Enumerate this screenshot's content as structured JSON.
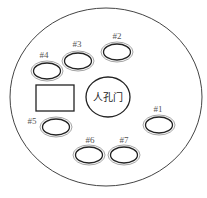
{
  "diagram": {
    "type": "layout-schematic",
    "outer_boundary": {
      "shape": "circle",
      "cx": 106,
      "cy": 97,
      "rx": 96,
      "ry": 89
    },
    "manhole": {
      "label": "人孔门",
      "cx": 108,
      "cy": 97,
      "rx": 22,
      "ry": 20
    },
    "rectangle": {
      "x": 36,
      "y": 85,
      "width": 38,
      "height": 26
    },
    "ports": [
      {
        "id": "#1",
        "label": "#1",
        "cx": 159,
        "cy": 125,
        "label_x": 158,
        "label_y": 112
      },
      {
        "id": "#2",
        "label": "#2",
        "cx": 117,
        "cy": 52,
        "label_x": 117,
        "label_y": 39
      },
      {
        "id": "#3",
        "label": "#3",
        "cx": 78,
        "cy": 61,
        "label_x": 77,
        "label_y": 47
      },
      {
        "id": "#4",
        "label": "#4",
        "cx": 47,
        "cy": 71,
        "label_x": 44,
        "label_y": 58
      },
      {
        "id": "#5",
        "label": "#5",
        "cx": 56,
        "cy": 127,
        "label_x": 32,
        "label_y": 124
      },
      {
        "id": "#6",
        "label": "#6",
        "cx": 89,
        "cy": 155,
        "label_x": 90,
        "label_y": 143
      },
      {
        "id": "#7",
        "label": "#7",
        "cx": 124,
        "cy": 155,
        "label_x": 124,
        "label_y": 143
      }
    ],
    "colors": {
      "stroke": "#333333",
      "inner_ring": "#999999",
      "background": "#ffffff"
    }
  }
}
